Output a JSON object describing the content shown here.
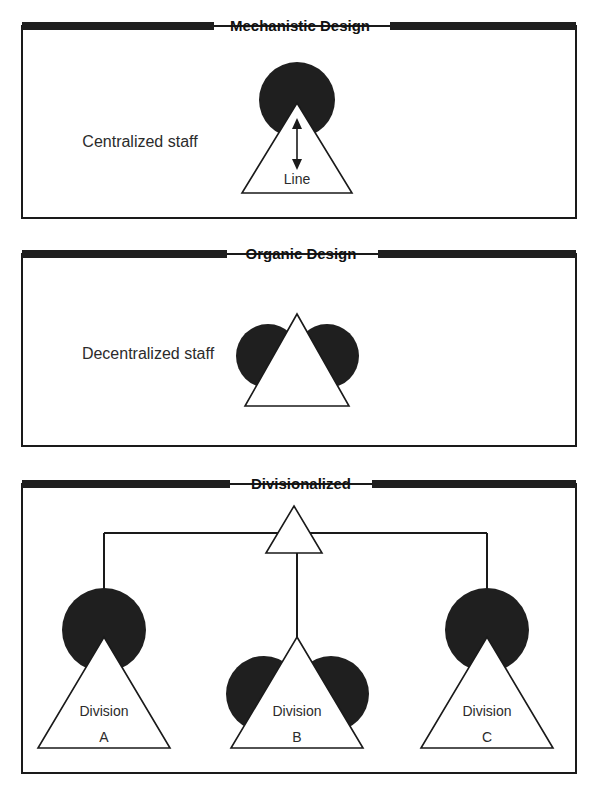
{
  "figure": {
    "background_color": "#ffffff",
    "ink_color": "#1f1f1f",
    "line_color": "#1a1a1a",
    "width": 596,
    "height": 789
  },
  "panels": [
    {
      "id": "mechanistic",
      "title": "Mechanistic Design",
      "staff_label": "Centralized staff",
      "unit_label": "Line",
      "shape": "single-blob-above-apex",
      "arrow": "double-headed-vertical"
    },
    {
      "id": "organic",
      "title": "Organic Design",
      "staff_label": "Decentralized staff",
      "unit_label": "",
      "shape": "two-blobs-flanking-triangle",
      "arrow": "none"
    },
    {
      "id": "divisionalized",
      "title": "Divisionalized",
      "staff_label": "",
      "unit_label": "",
      "shape": "hierarchy-three-divisions",
      "arrow": "none",
      "units": [
        {
          "name": "Division",
          "letter": "A",
          "shape": "single-blob-above-apex"
        },
        {
          "name": "Division",
          "letter": "B",
          "shape": "two-blobs-flanking-triangle"
        },
        {
          "name": "Division",
          "letter": "C",
          "shape": "single-blob-above-apex"
        }
      ],
      "apex_unit": {
        "name": "",
        "shape": "plain-triangle"
      }
    }
  ]
}
